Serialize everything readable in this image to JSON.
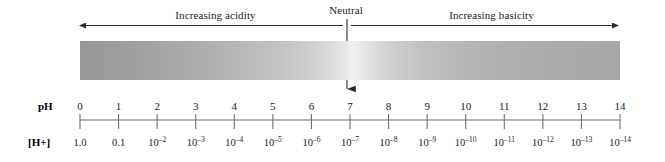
{
  "figure": {
    "top_annotations": {
      "acidity": "Increasing acidity",
      "neutral": "Neutral",
      "basicity": "Increasing basicity"
    },
    "row_labels": {
      "ph": "pH",
      "concentration": "[H+]"
    },
    "colors": {
      "acidic_end": "#979797",
      "neutral_light": "#efefef",
      "basic_end": "#a7a7a7",
      "line": "#3a3a3a",
      "text": "#1a1a1a"
    }
  },
  "chart_data": {
    "type": "table",
    "xlabel": "pH",
    "ylabel": "[H+]",
    "xlim": [
      0,
      14
    ],
    "grid": false,
    "legend": "none",
    "annotations": [
      {
        "text": "Increasing acidity",
        "range": [
          0,
          7
        ],
        "arrow": "left"
      },
      {
        "text": "Neutral",
        "at": 7,
        "arrow": "down"
      },
      {
        "text": "Increasing basicity",
        "range": [
          7,
          14
        ],
        "arrow": "right"
      }
    ],
    "categories": [
      "0",
      "1",
      "2",
      "3",
      "4",
      "5",
      "6",
      "7",
      "8",
      "9",
      "10",
      "11",
      "12",
      "13",
      "14"
    ],
    "series": [
      {
        "name": "[H+]",
        "labels": [
          "1.0",
          "0.1",
          "10−2",
          "10−3",
          "10−4",
          "10−5",
          "10−6",
          "10−7",
          "10−8",
          "10−9",
          "10−10",
          "10−11",
          "10−12",
          "10−13",
          "10−14"
        ],
        "values": [
          1.0,
          0.1,
          0.01,
          0.001,
          0.0001,
          1e-05,
          1e-06,
          1e-07,
          1e-08,
          1e-09,
          1e-10,
          1e-11,
          1e-12,
          1e-13,
          1e-14
        ]
      }
    ],
    "ph_ticks": [
      {
        "ph": "0",
        "mantissa": "1.0",
        "base": "",
        "exponent": ""
      },
      {
        "ph": "1",
        "mantissa": "0.1",
        "base": "",
        "exponent": ""
      },
      {
        "ph": "2",
        "mantissa": "",
        "base": "10",
        "exponent": "-2"
      },
      {
        "ph": "3",
        "mantissa": "",
        "base": "10",
        "exponent": "-3"
      },
      {
        "ph": "4",
        "mantissa": "",
        "base": "10",
        "exponent": "-4"
      },
      {
        "ph": "5",
        "mantissa": "",
        "base": "10",
        "exponent": "-5"
      },
      {
        "ph": "6",
        "mantissa": "",
        "base": "10",
        "exponent": "-6"
      },
      {
        "ph": "7",
        "mantissa": "",
        "base": "10",
        "exponent": "-7"
      },
      {
        "ph": "8",
        "mantissa": "",
        "base": "10",
        "exponent": "-8"
      },
      {
        "ph": "9",
        "mantissa": "",
        "base": "10",
        "exponent": "-9"
      },
      {
        "ph": "10",
        "mantissa": "",
        "base": "10",
        "exponent": "-10"
      },
      {
        "ph": "11",
        "mantissa": "",
        "base": "10",
        "exponent": "-11"
      },
      {
        "ph": "12",
        "mantissa": "",
        "base": "10",
        "exponent": "-12"
      },
      {
        "ph": "13",
        "mantissa": "",
        "base": "10",
        "exponent": "-13"
      },
      {
        "ph": "14",
        "mantissa": "",
        "base": "10",
        "exponent": "-14"
      }
    ]
  }
}
